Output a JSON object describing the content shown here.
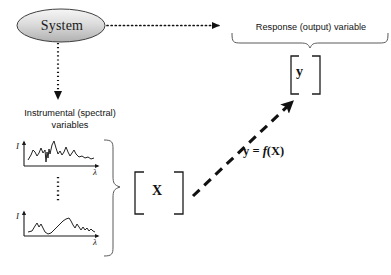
{
  "figure": {
    "background_color": "#ffffff",
    "width": 391,
    "height": 275
  },
  "nodes": {
    "system": {
      "label": "System",
      "shape": "ellipse",
      "fill_top_color": "#f2f2f2",
      "fill_bottom_color": "#b9b9b9",
      "stroke_color": "#3a3a3a"
    },
    "response_variable": {
      "label": "Response (output) variable",
      "vector_symbol": "y",
      "bracket": "square"
    },
    "instrumental_variables": {
      "label": "Instrumental (spectral)\nvariables",
      "matrix_symbol": "X",
      "bracket": "square"
    }
  },
  "relation": {
    "expression_y": "y",
    "expression_eq": " = ",
    "expression_f": "f",
    "expression_arg": "(X)",
    "full_expression": "y = f(X)"
  },
  "plots": {
    "axis_labels": {
      "y": "I",
      "x": "λ"
    },
    "ellipsis_between": "vertical-dotted-ellipsis",
    "spectrum_top": {
      "name": "spectrum-sample-1",
      "points": "M0,17 L4,14 L7,10 L10,13 L13,15 L16,12 L18,8 L20,12 L22,9 L23,20 L24,13 L25,17 L26,9 L27,13 L29,6 L31,3 L33,9 L35,13 L37,11 L39,14 L41,12 L43,8 L45,12 L47,15 L49,13 L51,10 L53,14 L56,16 L59,15 L62,17 L65,16 L68,18 L71,17 L74,18"
    },
    "spectrum_bottom": {
      "name": "spectrum-sample-n",
      "points": "M0,20 L4,19 L7,14 L9,11 L11,15 L13,12 L15,16 L17,20 L20,22 L23,21 L26,18 L29,15 L32,12 L35,9 L38,7 L41,6 L43,9 L45,13 L47,16 L49,12 L51,15 L53,18 L55,15 L57,18 L59,16 L61,19 L63,17 L65,19 L68,20 L71,20 L74,21"
    }
  },
  "arrows": {
    "system_to_response": {
      "style": "dotted",
      "direction": "right",
      "color": "#111111"
    },
    "system_to_instrumental": {
      "style": "dotted",
      "direction": "down",
      "color": "#111111"
    },
    "x_to_y": {
      "style": "dashed-thick",
      "direction": "up-right",
      "color": "#111111",
      "label": "y = f(X)"
    }
  },
  "braces": {
    "response_brace": {
      "orientation": "down",
      "color": "#555555"
    },
    "spectra_brace": {
      "orientation": "right",
      "color": "#555555"
    }
  }
}
